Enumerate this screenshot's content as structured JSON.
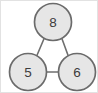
{
  "figure": {
    "name": "undirected-triangle-graph",
    "width": 98,
    "height": 93,
    "background_color": "#ffffff",
    "border_color": "#e2e2e2"
  },
  "style": {
    "node_fill": "#e6e6e6",
    "node_stroke": "#6b6b6b",
    "node_stroke_width": 1.7,
    "node_radius": 18.5,
    "label_color": "#3c3c3c",
    "label_font_size": 13.5,
    "edge_color": "#6f6f6f",
    "edge_width": 1.6
  },
  "graph": {
    "type": "undirected",
    "node_count": 3,
    "edge_count": 3,
    "nodes": [
      {
        "id": "top",
        "label": "8",
        "cx": 52,
        "cy": 21,
        "r": 18.5
      },
      {
        "id": "bottom-left",
        "label": "5",
        "cx": 27,
        "cy": 71,
        "r": 18.5
      },
      {
        "id": "bottom-right",
        "label": "6",
        "cx": 76,
        "cy": 71,
        "r": 18.5
      }
    ],
    "edges": [
      {
        "id": "edge-8-5",
        "from": "top",
        "to": "bottom-left",
        "x1": 43.2,
        "y1": 37.3,
        "x2": 35.8,
        "y2": 54.7
      },
      {
        "id": "edge-8-6",
        "from": "top",
        "to": "bottom-right",
        "x1": 60.8,
        "y1": 37.3,
        "x2": 67.2,
        "y2": 54.7
      },
      {
        "id": "edge-5-6",
        "from": "bottom-left",
        "to": "bottom-right",
        "x1": 45.5,
        "y1": 71.0,
        "x2": 57.5,
        "y2": 71.0
      }
    ]
  }
}
